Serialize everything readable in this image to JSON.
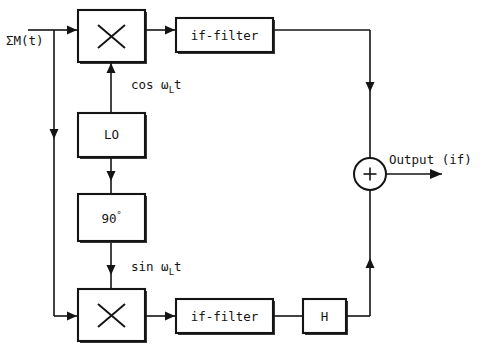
{
  "diagram": {
    "background_color": "#ffffff",
    "line_color": "#141414",
    "input": {
      "label": "ΣM(t)",
      "name": "sum-m-of-t"
    },
    "output": {
      "label": "Output (if)",
      "name": "output-if"
    },
    "blocks": [
      {
        "id": "mixer_top",
        "label": "✕",
        "kind": "mixer"
      },
      {
        "id": "if_filter_top",
        "label": "if-filter",
        "kind": "filter"
      },
      {
        "id": "lo",
        "label": "LO",
        "kind": "oscillator"
      },
      {
        "id": "phase_shift",
        "label": "90°",
        "kind": "phase-shifter"
      },
      {
        "id": "mixer_bottom",
        "label": "✕",
        "kind": "mixer"
      },
      {
        "id": "if_filter_bot",
        "label": "if-filter",
        "kind": "filter"
      },
      {
        "id": "hilbert",
        "label": "H",
        "kind": "hilbert"
      },
      {
        "id": "summer",
        "label": "+",
        "kind": "summing-junction"
      }
    ],
    "signals": {
      "cos": {
        "fn": "cos",
        "omega": "ω",
        "sub": "L",
        "var": "t",
        "full": "cos ωₗt"
      },
      "sin": {
        "fn": "sin",
        "omega": "ω",
        "sub": "L",
        "var": "t",
        "full": "sin ωₗt"
      }
    },
    "block_labels": {
      "mixer_top": "✕",
      "if_filter_top": "if-filter",
      "lo": "LO",
      "phase_shift_num": "90",
      "phase_shift_deg": "°",
      "mixer_bottom": "✕",
      "if_filter_bottom": "if-filter",
      "hilbert": "H",
      "summer_sign": "+"
    }
  }
}
